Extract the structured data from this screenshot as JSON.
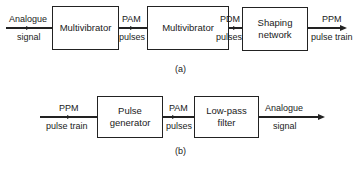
{
  "diagram_a": {
    "caption": "(a)",
    "input": {
      "top": "Analogue",
      "bottom": "signal"
    },
    "blocks": [
      {
        "label": "Multivibrator"
      },
      {
        "label": "Multivibrator"
      },
      {
        "label": "Shaping network",
        "line1": "Shaping",
        "line2": "network"
      }
    ],
    "links": [
      {
        "top": "PAM",
        "bottom": "pulses"
      },
      {
        "top": "PDM",
        "bottom": "pulses"
      }
    ],
    "output": {
      "top": "PPM",
      "bottom": "pulse train"
    }
  },
  "diagram_b": {
    "caption": "(b)",
    "input": {
      "top": "PPM",
      "bottom": "pulse train"
    },
    "blocks": [
      {
        "label": "Pulse generator",
        "line1": "Pulse",
        "line2": "generator"
      },
      {
        "label": "Low-pass filter",
        "line1": "Low-pass",
        "line2": "filter"
      }
    ],
    "links": [
      {
        "top": "PAM",
        "bottom": "pulses"
      }
    ],
    "output": {
      "top": "Analogue",
      "bottom": "signal"
    }
  }
}
